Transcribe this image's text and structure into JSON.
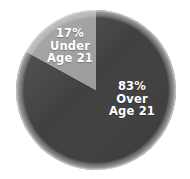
{
  "chart_data": {
    "type": "pie",
    "title": "",
    "subtitle": "",
    "xlabel": "",
    "ylabel": "",
    "legend_position": "none",
    "grid": false,
    "categories": [
      "Under Age 21",
      "Over Age 21"
    ],
    "values": [
      17,
      83
    ],
    "value_unit": "%",
    "start_angle_deg": 0,
    "direction": "counterclockwise",
    "slices": [
      {
        "name": "under-21",
        "category": "Under Age 21",
        "value": 17,
        "percent_text": "17%",
        "line1": "17%",
        "line2": "Under",
        "line3": "Age 21",
        "color": "#9b9b9b",
        "label_color": "#ffffff"
      },
      {
        "name": "over-21",
        "category": "Over Age 21",
        "value": 83,
        "percent_text": "83%",
        "line1": "83%",
        "line2": "Over",
        "line3": "Age 21",
        "color": "#3d3d3d",
        "label_color": "#ffffff"
      }
    ],
    "annotations": []
  },
  "figure": {
    "background_color": "#ffffff",
    "edge_highlight_color": "#d8d8d8",
    "center_x": 96,
    "center_y": 90,
    "radius": 80
  }
}
